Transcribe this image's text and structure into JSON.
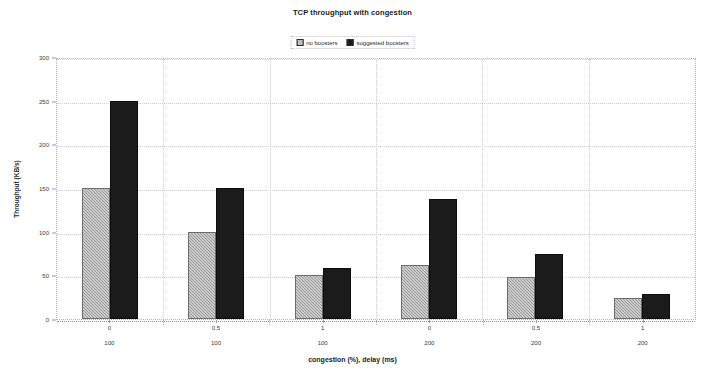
{
  "chart_data": {
    "type": "bar",
    "title": "TCP throughput with congestion",
    "xlabel": "congestion (%), delay (ms)",
    "ylabel": "Throughput (KB/s)",
    "categories": [
      "0",
      "0.5",
      "1",
      "0",
      "0.5",
      "1"
    ],
    "secondary_categories": [
      "100",
      "100",
      "100",
      "200",
      "200",
      "200"
    ],
    "series": [
      {
        "name": "no boosters",
        "color": "#9d9d9d",
        "values": [
          150,
          100,
          50,
          62,
          48,
          24
        ]
      },
      {
        "name": "suggested boosters",
        "color": "#1b1b1b",
        "values": [
          250,
          150,
          58,
          137,
          75,
          29
        ]
      }
    ],
    "ylim": [
      0,
      300
    ],
    "yticks": [
      0,
      50,
      100,
      150,
      200,
      250,
      300
    ],
    "ytick_labels": [
      "0",
      "50",
      "100",
      "150",
      "200",
      "250",
      "300"
    ],
    "grid": true,
    "legend_position": "top-center"
  },
  "legend": {
    "items": [
      {
        "label": "no boosters",
        "swatch": "hatched-gray-square-icon"
      },
      {
        "label": "suggested boosters",
        "swatch": "solid-black-square-icon"
      }
    ]
  }
}
